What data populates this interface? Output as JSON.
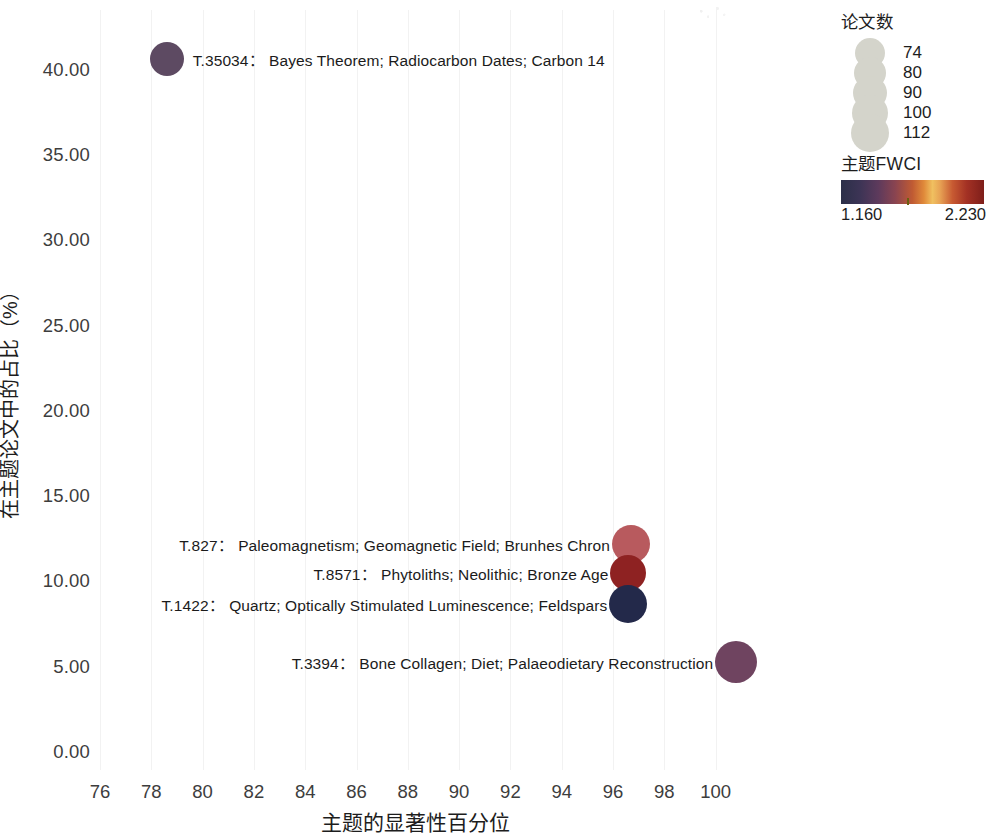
{
  "chart_data": {
    "type": "scatter",
    "title": "",
    "xlabel": "主题的显著性百分位",
    "ylabel": "在主题论文中的占比（%）",
    "xlim": [
      75,
      101
    ],
    "ylim": [
      -1.5,
      42.5
    ],
    "grid": "faint vertical gridlines only",
    "x_ticks": [
      "76",
      "78",
      "80",
      "82",
      "84",
      "86",
      "88",
      "90",
      "92",
      "94",
      "96",
      "98",
      "100"
    ],
    "x_tick_values": [
      76,
      78,
      80,
      82,
      84,
      86,
      88,
      90,
      92,
      94,
      96,
      98,
      100
    ],
    "y_ticks": [
      "0.00",
      "5.00",
      "10.00",
      "15.00",
      "20.00",
      "25.00",
      "30.00",
      "35.00",
      "40.00"
    ],
    "y_tick_values": [
      0,
      5,
      10,
      15,
      20,
      25,
      30,
      35,
      40
    ],
    "points": [
      {
        "id": "T.35034",
        "label": "T.35034：  Bayes Theorem; Radiocarbon Dates; Carbon 14",
        "x": 78.6,
        "y": 40.6,
        "size": 95,
        "radius_px": 17,
        "color": "#5d4a62",
        "label_side": "right"
      },
      {
        "id": "T.827",
        "label": "T.827：  Paleomagnetism; Geomagnetic Field; Brunhes Chron",
        "x": 96.7,
        "y": 12.2,
        "size": 100,
        "radius_px": 19,
        "color": "#b85a5e",
        "label_side": "left"
      },
      {
        "id": "T.8571",
        "label": "T.8571：  Phytoliths; Neolithic; Bronze Age",
        "x": 96.6,
        "y": 10.5,
        "size": 90,
        "radius_px": 18,
        "color": "#8e2222",
        "label_side": "left"
      },
      {
        "id": "T.1422",
        "label": "T.1422：  Quartz; Optically Stimulated Luminescence; Feldspars",
        "x": 96.6,
        "y": 8.7,
        "size": 100,
        "radius_px": 19,
        "color": "#23294a",
        "label_side": "left"
      },
      {
        "id": "T.3394",
        "label": "T.3394：  Bone Collagen; Diet; Palaeodietary Reconstruction",
        "x": 100.8,
        "y": 5.3,
        "size": 112,
        "radius_px": 21,
        "color": "#6f4460",
        "label_side": "left"
      }
    ],
    "size_legend": {
      "title": "论文数",
      "entries": [
        {
          "label": "74",
          "value": 74,
          "radius_px": 15
        },
        {
          "label": "80",
          "value": 80,
          "radius_px": 16
        },
        {
          "label": "90",
          "value": 90,
          "radius_px": 17
        },
        {
          "label": "100",
          "value": 100,
          "radius_px": 18
        },
        {
          "label": "112",
          "value": 112,
          "radius_px": 19
        }
      ],
      "swatch_color": "#d4d4cb"
    },
    "color_legend": {
      "title": "主题FWCI",
      "min_label": "1.160",
      "max_label": "2.230",
      "min_value": 1.16,
      "max_value": 2.23,
      "tick_position_fraction": 0.46,
      "gradient_stops": [
        "#2b2f48",
        "#5d3a5c",
        "#c05b33",
        "#f0c060",
        "#a33124",
        "#7e1e1a"
      ]
    }
  }
}
